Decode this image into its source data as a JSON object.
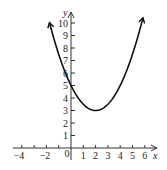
{
  "chart_data": {
    "type": "line",
    "title": "",
    "xlabel": "x",
    "ylabel": "y",
    "function": "y = 0.5(x - 2)^2 + 3",
    "vertex": [
      2,
      3
    ],
    "y_intercept": [
      0,
      5
    ],
    "xlim": [
      -4.5,
      6.5
    ],
    "ylim": [
      -0.5,
      11
    ],
    "x_ticks": [
      -4,
      -3,
      -2,
      -1,
      0,
      1,
      2,
      3,
      4,
      5,
      6
    ],
    "x_tick_labels": [
      "-4",
      "-2",
      "0",
      "1",
      "2",
      "3",
      "4",
      "5",
      "6"
    ],
    "y_ticks": [
      1,
      2,
      3,
      4,
      5,
      6,
      7,
      8,
      9,
      10
    ],
    "y_tick_labels": [
      "1",
      "2",
      "3",
      "4",
      "5",
      "6",
      "7",
      "8",
      "9",
      "10"
    ],
    "grid": false,
    "series": [
      {
        "name": "parabola",
        "x": [
          -1.7,
          -1,
          0,
          1,
          2,
          3,
          4,
          5,
          5.9
        ],
        "y": [
          9.85,
          7.5,
          5,
          3.5,
          3,
          3.5,
          5,
          7.5,
          10.6
        ]
      }
    ]
  },
  "labels": {
    "x_axis": "x",
    "y_axis": "y",
    "x": {
      "n4": "−4",
      "n2": "−2",
      "z": "0",
      "p1": "1",
      "p2": "2",
      "p3": "3",
      "p4": "4",
      "p5": "5",
      "p6": "6"
    },
    "y": {
      "p1": "1",
      "p2": "2",
      "p3": "3",
      "p4": "4",
      "p5": "5",
      "p6": "6",
      "p7": "7",
      "p8": "8",
      "p9": "9",
      "p10": "10"
    }
  }
}
